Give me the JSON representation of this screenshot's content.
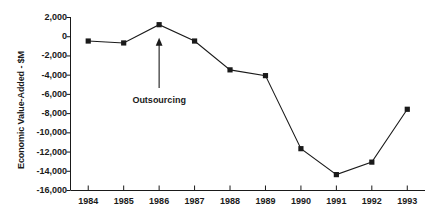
{
  "chart_data": {
    "type": "line",
    "title": "",
    "subtitle": "",
    "xlabel": "",
    "ylabel": "Economic Value-Added - $M",
    "categories": [
      "1984",
      "1985",
      "1986",
      "1987",
      "1988",
      "1989",
      "1990",
      "1991",
      "1992",
      "1993"
    ],
    "x": [
      1984,
      1985,
      1986,
      1987,
      1988,
      1989,
      1990,
      1991,
      1992,
      1993
    ],
    "values": [
      -500,
      -700,
      1200,
      -500,
      -3500,
      -4100,
      -11700,
      -14400,
      -13100,
      -7600
    ],
    "series": [
      {
        "name": "Economic Value-Added",
        "values": [
          -500,
          -700,
          1200,
          -500,
          -3500,
          -4100,
          -11700,
          -14400,
          -13100,
          -7600
        ]
      }
    ],
    "ylim": [
      -16000,
      2000
    ],
    "yticks": [
      2000,
      0,
      -2000,
      -4000,
      -6000,
      -8000,
      -10000,
      -12000,
      -14000,
      -16000
    ],
    "ytick_labels": [
      "2,000",
      "0",
      "-2,000",
      "-4,000",
      "-6,000",
      "-8,000",
      "-10,000",
      "-12,000",
      "-14,000",
      "-16,000"
    ],
    "grid": false,
    "legend": null,
    "marker": "square",
    "line_color": "#1a1a1a",
    "marker_color": "#1a1a1a",
    "background_color": "#ffffff",
    "annotations": [
      {
        "text": "Outsourcing",
        "points_to_category": "1986",
        "points_to_value": 1200,
        "style": "up-arrow"
      }
    ]
  }
}
